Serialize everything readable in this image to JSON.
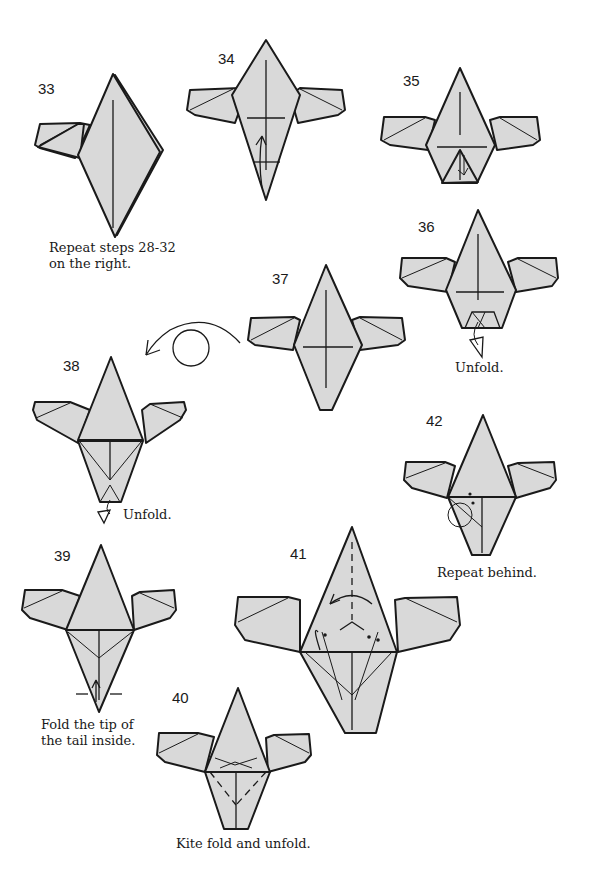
{
  "page": {
    "background": "#ffffff",
    "paper_color": "#d9d9d9",
    "line_color": "#1a1a1a"
  },
  "steps": [
    {
      "number": "33",
      "caption": "Repeat steps 28-32\non the right.",
      "caption_lines": [
        "Repeat steps 28-32",
        "on the right."
      ]
    },
    {
      "number": "34",
      "caption_lines": []
    },
    {
      "number": "35",
      "caption_lines": []
    },
    {
      "number": "36",
      "caption_lines": [
        "Unfold."
      ]
    },
    {
      "number": "37",
      "caption_lines": []
    },
    {
      "number": "38",
      "caption_lines": [
        "Unfold."
      ]
    },
    {
      "number": "39",
      "caption_lines": [
        "Fold the tip of",
        "the tail inside."
      ]
    },
    {
      "number": "40",
      "caption_lines": [
        "Kite fold and unfold."
      ]
    },
    {
      "number": "41",
      "caption_lines": []
    },
    {
      "number": "42",
      "caption_lines": [
        "Repeat behind."
      ]
    }
  ]
}
